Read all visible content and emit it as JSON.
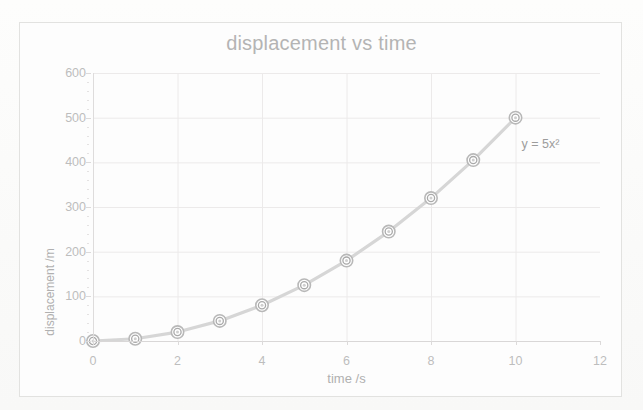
{
  "chart_data": {
    "type": "line",
    "title": "displacement vs time",
    "xlabel": "time /s",
    "ylabel": "displacement /m",
    "xlim": [
      0,
      12
    ],
    "ylim": [
      0,
      600
    ],
    "xticks": [
      0,
      2,
      4,
      6,
      8,
      10,
      12
    ],
    "yticks": [
      0,
      100,
      200,
      300,
      400,
      500,
      600
    ],
    "xtick_labels": [
      "0",
      "2",
      "4",
      "6",
      "8",
      "10",
      "12"
    ],
    "ytick_labels": [
      "0",
      "100",
      "200",
      "300",
      "400",
      "500",
      "600"
    ],
    "grid": true,
    "legend": false,
    "legend_position": "none",
    "annotations": [
      {
        "text": "y = 5x²",
        "x": 10.9,
        "y": 440
      }
    ],
    "series": [
      {
        "name": "displacement",
        "marker": "circle",
        "line_color": "#d6d6d6",
        "marker_color": "#b8b8b8",
        "x": [
          0,
          1,
          2,
          3,
          4,
          5,
          6,
          7,
          8,
          9,
          10
        ],
        "values": [
          0,
          5,
          20,
          45,
          80,
          125,
          180,
          245,
          320,
          405,
          500
        ]
      }
    ]
  },
  "figure": {
    "title": "displacement vs time",
    "xaxis_title": "time /s",
    "yaxis_title": "displacement /m",
    "equation_label": "y = 5x²",
    "background_color": "#fdfdfd",
    "frame_color": "#e2e2e0",
    "grid_color": "#eceaea",
    "text_color": "#bdbdbd",
    "title_color": "#b4b4b4"
  }
}
